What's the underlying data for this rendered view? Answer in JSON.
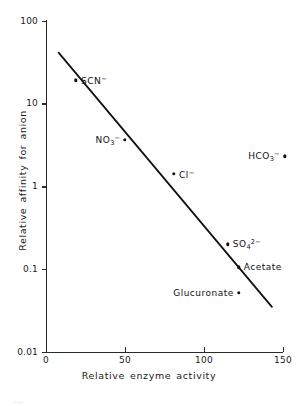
{
  "chart_data": {
    "type": "scatter",
    "title": "",
    "xlabel": "Relative enzyme activity",
    "ylabel": "Relative affinity for anion",
    "xscale": "linear",
    "yscale": "log",
    "xlim": [
      0,
      150
    ],
    "ylim": [
      0.01,
      100
    ],
    "grid": false,
    "legend": false,
    "xticks": [
      "0",
      "50",
      "100",
      "150"
    ],
    "xtick_values": [
      0,
      50,
      100,
      150
    ],
    "yticks": [
      "100",
      "10",
      "1",
      "0.1",
      "0.01"
    ],
    "ytick_values": [
      100,
      10,
      1,
      0.1,
      0.01
    ],
    "points": [
      {
        "label": "SCN⁻",
        "label_html": "SCN<sup>−</sup>",
        "x": 19,
        "y": 19,
        "label_side": "right"
      },
      {
        "label": "NO₃⁻",
        "label_html": "NO<sub>3</sub><sup>−</sup>",
        "x": 50,
        "y": 3.6,
        "label_side": "left"
      },
      {
        "label": "Cl⁻",
        "label_html": "Cl<sup>−</sup>",
        "x": 81,
        "y": 1.4,
        "label_side": "right"
      },
      {
        "label": "HCO₃⁻",
        "label_html": "HCO<sub>3</sub><sup>−</sup>",
        "x": 151,
        "y": 2.3,
        "label_side": "left"
      },
      {
        "label": "SO₄²⁻",
        "label_html": "SO<sub>4</sub><sup>2−</sup>",
        "x": 115,
        "y": 0.2,
        "label_side": "right"
      },
      {
        "label": "Acetate",
        "label_html": "Acetate",
        "x": 122,
        "y": 0.105,
        "label_side": "right"
      },
      {
        "label": "Glucuronate",
        "label_html": "Glucuronate",
        "x": 122,
        "y": 0.052,
        "label_side": "left"
      }
    ],
    "trend_line": {
      "name": "regression line",
      "x_start": 8,
      "y_start": 41,
      "x_end": 143,
      "y_end": 0.035
    }
  },
  "caption": {
    "text": "…"
  }
}
